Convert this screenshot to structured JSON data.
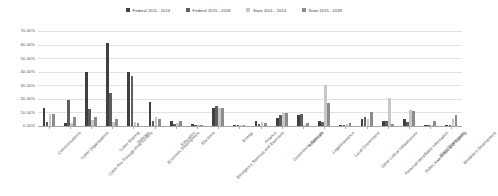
{
  "legend": {
    "position": "top-center",
    "items": [
      {
        "label": "Federal  2011 - 2014",
        "color": "#404040"
      },
      {
        "label": "Federal  2015 - 2018",
        "color": "#5e5e5e"
      },
      {
        "label": "State  2011 - 2014",
        "color": "#c8c8c8"
      },
      {
        "label": "State  2015 - 2018",
        "color": "#8c8c8c"
      }
    ]
  },
  "yaxis": {
    "ticks": [
      "0.00%",
      "10.00%",
      "20.00%",
      "30.00%",
      "40.00%",
      "50.00%",
      "60.00%",
      "70.00%"
    ],
    "min": 0,
    "max": 70
  },
  "chart_data": {
    "type": "bar",
    "title": "",
    "subtitle": "",
    "xlabel": "",
    "ylabel": "",
    "ylim": [
      0,
      70
    ],
    "ytick_values": [
      0,
      10,
      20,
      30,
      40,
      50,
      60,
      70
    ],
    "ytick_labels": [
      "0.00%",
      "10.00%",
      "20.00%",
      "30.00%",
      "40.00%",
      "50.00%",
      "60.00%",
      "70.00%"
    ],
    "grid": true,
    "legend_position": "top-center",
    "value_format": "percent",
    "categories": [
      "Communications",
      "Cyber Organizations",
      "Cyber Pre-Through-Post Incident",
      "Cyber Sharing",
      "Defense",
      "Economic Development",
      "Education",
      "Elections",
      "Emergency Services and Exercises",
      "Energy",
      "Finance",
      "Government Services",
      "Healthcare",
      "Legal/Insurance",
      "Local Government",
      "Other Critical Infrastructure",
      "Personal Identifiable Information",
      "Public Awareness and Training",
      "Water/Wastewater",
      "Workforce Development"
    ],
    "series": [
      {
        "name": "Federal  2011 - 2014",
        "color": "#404040",
        "values": [
          13.0,
          2.0,
          40.0,
          61.0,
          40.0,
          18.0,
          4.0,
          1.5,
          13.5,
          1.0,
          4.0,
          6.0,
          8.0,
          4.0,
          1.0,
          5.0,
          4.0,
          5.0,
          1.0,
          1.0
        ]
      },
      {
        "name": "Federal  2015 - 2018",
        "color": "#5e5e5e",
        "values": [
          3.0,
          19.0,
          12.5,
          24.0,
          37.0,
          4.0,
          1.5,
          0.5,
          14.5,
          1.0,
          1.5,
          8.0,
          9.0,
          3.0,
          1.0,
          6.5,
          3.5,
          3.0,
          0.5,
          0.5
        ]
      },
      {
        "name": "State  2011 - 2014",
        "color": "#c8c8c8",
        "values": [
          9.0,
          2.0,
          4.5,
          3.0,
          3.0,
          6.5,
          2.5,
          0.5,
          13.0,
          0.5,
          3.0,
          9.5,
          1.0,
          30.0,
          1.5,
          5.0,
          21.0,
          12.0,
          1.0,
          5.0
        ]
      },
      {
        "name": "State  2015 - 2018",
        "color": "#8c8c8c",
        "values": [
          8.5,
          7.0,
          7.0,
          5.5,
          2.0,
          5.0,
          3.5,
          1.0,
          13.5,
          0.5,
          2.0,
          9.5,
          2.0,
          17.0,
          2.0,
          10.0,
          1.5,
          11.0,
          4.0,
          8.0
        ]
      }
    ]
  }
}
